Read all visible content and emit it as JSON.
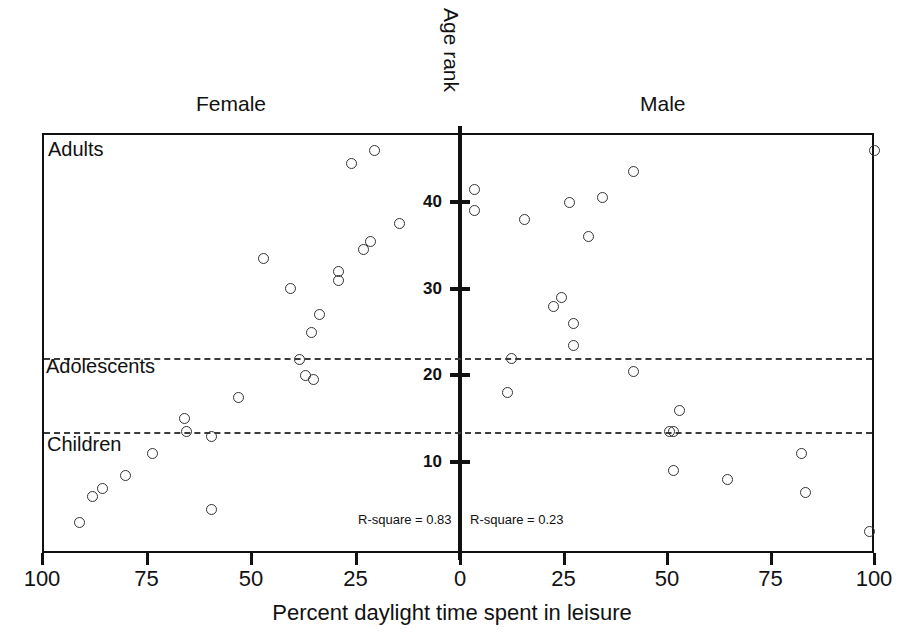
{
  "titles": {
    "female_panel": "Female",
    "male_panel": "Male",
    "y_axis": "Age rank",
    "x_axis": "Percent daylight time spent in leisure"
  },
  "group_labels": {
    "adults": "Adults",
    "adolescents": "Adolescents",
    "children": "Children"
  },
  "stats": {
    "female_rsquare": "R-square = 0.83",
    "male_rsquare": "R-square = 0.23"
  },
  "axes": {
    "y_ticks": [
      "10",
      "20",
      "30",
      "40"
    ],
    "x_ticks": [
      "100",
      "75",
      "50",
      "25",
      "0",
      "25",
      "50",
      "75",
      "100"
    ]
  },
  "chart_data": {
    "type": "scatter",
    "title": "",
    "xlabel": "Percent daylight time spent in leisure",
    "ylabel": "Age rank",
    "grid": false,
    "legend": "none",
    "layout": "mirrored back-to-back panels sharing a central vertical Age rank axis",
    "xlim_female": [
      100,
      0
    ],
    "xlim_male": [
      0,
      100
    ],
    "ylim": [
      0,
      48
    ],
    "y_tick_values": [
      10,
      20,
      30,
      40
    ],
    "x_tick_values_female": [
      100,
      75,
      50,
      25,
      0
    ],
    "x_tick_values_male": [
      0,
      25,
      50,
      75,
      100
    ],
    "reference_lines": [
      {
        "label": "Adolescents boundary",
        "y": 22.0,
        "style": "dashed"
      },
      {
        "label": "Children boundary",
        "y": 13.5,
        "style": "dashed"
      }
    ],
    "annotations": [
      {
        "text": "Adults",
        "region": "top band above y=22"
      },
      {
        "text": "Adolescents",
        "region": "band between y=13.5 and y=22"
      },
      {
        "text": "Children",
        "region": "bottom band below y=13.5"
      },
      {
        "text": "R-square = 0.83",
        "panel": "Female"
      },
      {
        "text": "R-square = 0.23",
        "panel": "Male"
      }
    ],
    "series": [
      {
        "name": "Female",
        "panel": "left",
        "r_square": 0.83,
        "marker": "open circle",
        "points": [
          {
            "percent_leisure": 20.5,
            "age_rank": 46.0
          },
          {
            "percent_leisure": 26.0,
            "age_rank": 44.5
          },
          {
            "percent_leisure": 14.5,
            "age_rank": 37.5
          },
          {
            "percent_leisure": 21.5,
            "age_rank": 35.5
          },
          {
            "percent_leisure": 23.0,
            "age_rank": 34.5
          },
          {
            "percent_leisure": 47.0,
            "age_rank": 33.5
          },
          {
            "percent_leisure": 29.0,
            "age_rank": 32.0
          },
          {
            "percent_leisure": 29.0,
            "age_rank": 31.0
          },
          {
            "percent_leisure": 40.5,
            "age_rank": 30.0
          },
          {
            "percent_leisure": 33.5,
            "age_rank": 27.0
          },
          {
            "percent_leisure": 35.5,
            "age_rank": 25.0
          },
          {
            "percent_leisure": 38.5,
            "age_rank": 21.8
          },
          {
            "percent_leisure": 37.0,
            "age_rank": 20.0
          },
          {
            "percent_leisure": 35.0,
            "age_rank": 19.5
          },
          {
            "percent_leisure": 53.0,
            "age_rank": 17.5
          },
          {
            "percent_leisure": 66.0,
            "age_rank": 15.0
          },
          {
            "percent_leisure": 65.5,
            "age_rank": 13.5
          },
          {
            "percent_leisure": 59.5,
            "age_rank": 13.0
          },
          {
            "percent_leisure": 73.5,
            "age_rank": 11.0
          },
          {
            "percent_leisure": 80.0,
            "age_rank": 8.5
          },
          {
            "percent_leisure": 85.5,
            "age_rank": 7.0
          },
          {
            "percent_leisure": 88.0,
            "age_rank": 6.0
          },
          {
            "percent_leisure": 59.5,
            "age_rank": 4.5
          },
          {
            "percent_leisure": 91.0,
            "age_rank": 3.0
          }
        ]
      },
      {
        "name": "Male",
        "panel": "right",
        "r_square": 0.23,
        "marker": "open circle",
        "points": [
          {
            "percent_leisure": 100.0,
            "age_rank": 46.0
          },
          {
            "percent_leisure": 42.0,
            "age_rank": 43.5
          },
          {
            "percent_leisure": 3.5,
            "age_rank": 41.5
          },
          {
            "percent_leisure": 34.5,
            "age_rank": 40.5
          },
          {
            "percent_leisure": 3.5,
            "age_rank": 39.0
          },
          {
            "percent_leisure": 26.5,
            "age_rank": 40.0
          },
          {
            "percent_leisure": 15.5,
            "age_rank": 38.0
          },
          {
            "percent_leisure": 31.0,
            "age_rank": 36.0
          },
          {
            "percent_leisure": 24.5,
            "age_rank": 29.0
          },
          {
            "percent_leisure": 22.5,
            "age_rank": 28.0
          },
          {
            "percent_leisure": 27.5,
            "age_rank": 26.0
          },
          {
            "percent_leisure": 27.5,
            "age_rank": 23.5
          },
          {
            "percent_leisure": 12.5,
            "age_rank": 22.0
          },
          {
            "percent_leisure": 42.0,
            "age_rank": 20.5
          },
          {
            "percent_leisure": 11.5,
            "age_rank": 18.0
          },
          {
            "percent_leisure": 53.0,
            "age_rank": 16.0
          },
          {
            "percent_leisure": 51.5,
            "age_rank": 13.5
          },
          {
            "percent_leisure": 50.5,
            "age_rank": 13.5
          },
          {
            "percent_leisure": 82.5,
            "age_rank": 11.0
          },
          {
            "percent_leisure": 51.5,
            "age_rank": 9.0
          },
          {
            "percent_leisure": 64.5,
            "age_rank": 8.0
          },
          {
            "percent_leisure": 83.5,
            "age_rank": 6.5
          },
          {
            "percent_leisure": 99.0,
            "age_rank": 2.0
          }
        ]
      }
    ]
  }
}
